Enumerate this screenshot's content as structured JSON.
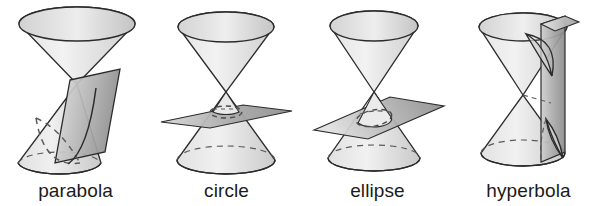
{
  "page": {
    "background_color": "#ffffff",
    "width": 604,
    "height": 206
  },
  "palette": {
    "outline": "#2b2b2b",
    "cone_light": "#efefef",
    "cone_mid": "#dcdcdc",
    "cone_shadow": "#bfbfbf",
    "plane_light": "#dadada",
    "plane_dark": "#9a9a9a",
    "plane_darkest": "#8a8a8a",
    "dashed_curve": "#4a4a4a",
    "label_color": "#1b1b1b"
  },
  "figures": [
    {
      "id": "parabola",
      "label": "parabola",
      "icon": "double-cone-with-oblique-plane",
      "description": "Double cone cut by a plane parallel to one side, producing an open curve",
      "plane_orientation": "oblique-steep",
      "curve_type": "open-unbounded",
      "cone_count": 2,
      "intersections": 1
    },
    {
      "id": "circle",
      "label": "circle",
      "icon": "double-cone-with-horizontal-plane",
      "description": "Double cone cut by a plane perpendicular to the axis, producing a closed round curve",
      "plane_orientation": "horizontal",
      "curve_type": "closed-round",
      "cone_count": 2,
      "intersections": 1
    },
    {
      "id": "ellipse",
      "label": "ellipse",
      "icon": "double-cone-with-tilted-plane",
      "description": "Double cone cut by a tilted plane crossing one nappe, producing a closed oval curve",
      "plane_orientation": "tilted",
      "curve_type": "closed-oval",
      "cone_count": 2,
      "intersections": 1
    },
    {
      "id": "hyperbola",
      "label": "hyperbola",
      "icon": "double-cone-with-vertical-plane",
      "description": "Double cone cut by a vertical plane parallel to the axis, producing two separate branches",
      "plane_orientation": "vertical",
      "curve_type": "two-branches",
      "cone_count": 2,
      "intersections": 2
    }
  ]
}
